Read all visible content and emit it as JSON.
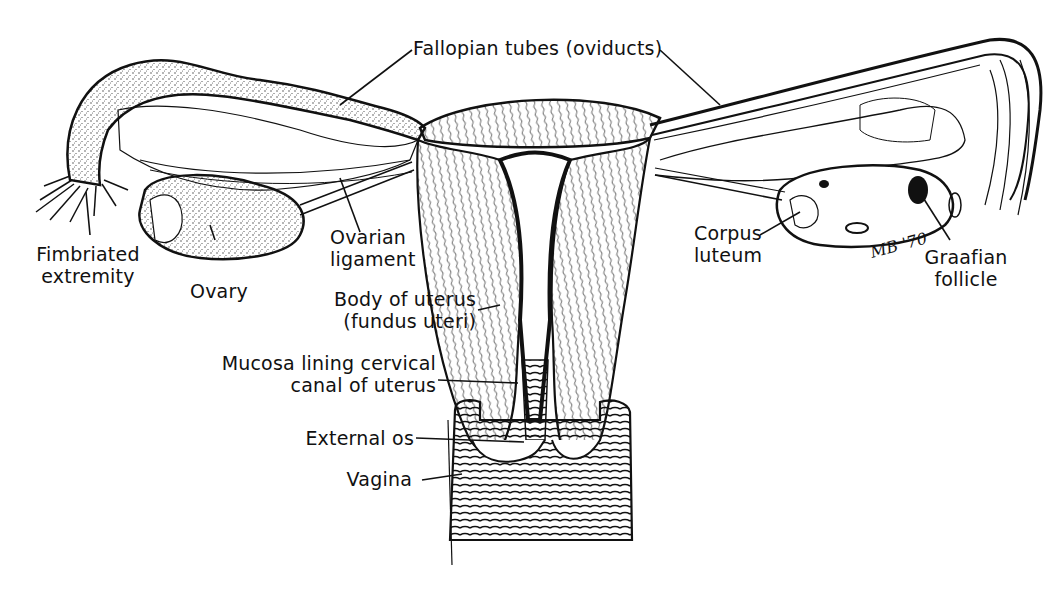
{
  "diagram": {
    "signature": "MB '70",
    "labels": {
      "fallopian_tubes": "Fallopian tubes (oviducts)",
      "fimbriated_extremity": [
        "Fimbriated",
        "extremity"
      ],
      "ovary": "Ovary",
      "ovarian_ligament": [
        "Ovarian",
        "ligament"
      ],
      "body_of_uterus": [
        "Body of uterus",
        "(fundus uteri)"
      ],
      "mucosa_lining": [
        "Mucosa lining cervical",
        "canal of uterus"
      ],
      "external_os": "External os",
      "vagina": "Vagina",
      "corpus_luteum": [
        "Corpus",
        "luteum"
      ],
      "graafian_follicle": [
        "Graafian",
        "follicle"
      ]
    },
    "colors": {
      "ink": "#111111",
      "background": "#ffffff",
      "stipple": "#555555"
    }
  }
}
